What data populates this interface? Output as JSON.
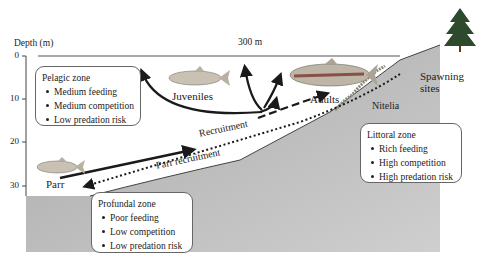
{
  "axis": {
    "title": "Depth (m)",
    "ticks": [
      "0",
      "10",
      "20",
      "30"
    ],
    "width_label": "300 m"
  },
  "zones": {
    "pelagic": {
      "title": "Pelagic zone",
      "items": [
        "Medium feeding",
        "Medium competition",
        "Low predation risk"
      ]
    },
    "profundal": {
      "title": "Profundal zone",
      "items": [
        "Poor feeding",
        "Low competition",
        "Low predation risk"
      ]
    },
    "littoral": {
      "title": "Littoral zone",
      "items": [
        "Rich feeding",
        "High competition",
        "High predation risk"
      ]
    }
  },
  "labels": {
    "juveniles": "Juveniles",
    "adults": "Adults",
    "parr": "Parr",
    "spawning_sites": [
      "Spawning",
      "sites"
    ],
    "nitelia": "Nitelia",
    "recruitment": "Recruitment",
    "parr_recruitment": "Parr recruitment"
  },
  "colors": {
    "lake_bed": "#b9b9b9",
    "water": "#ffffff",
    "fish_body": "#c9c2b2",
    "adult_stripe": "#8a4f4a",
    "arrow": "#1a1a1a"
  }
}
